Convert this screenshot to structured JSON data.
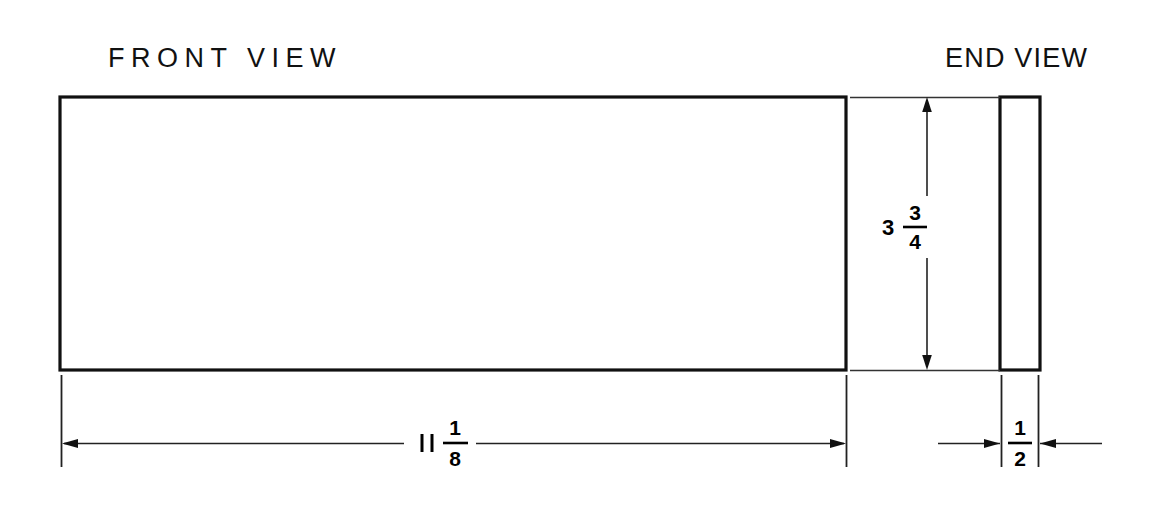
{
  "drawing": {
    "background_color": "#ffffff",
    "line_color": "#111111",
    "thin_line_color": "#333333",
    "views": [
      {
        "name": "front-view",
        "label": "FRONT VIEW",
        "shape": "rectangle",
        "x": 60,
        "y": 97,
        "width": 786,
        "height": 273,
        "line_weight": 3
      },
      {
        "name": "end-view",
        "label": "END VIEW",
        "shape": "rectangle",
        "x": 1000,
        "y": 97,
        "width": 40,
        "height": 273,
        "line_weight": 3
      }
    ],
    "dimensions": [
      {
        "name": "height-dimension",
        "value": "3 3/4",
        "whole": "3",
        "numerator": "3",
        "denominator": "4",
        "orientation": "vertical",
        "applies_to": "end-view",
        "from": 97,
        "to": 370,
        "line_x": 927,
        "arrow_style": "inside"
      },
      {
        "name": "length-dimension",
        "value": "11 1/8",
        "whole": "11",
        "numerator": "1",
        "denominator": "8",
        "orientation": "horizontal",
        "applies_to": "front-view",
        "from": 62,
        "to": 846,
        "line_y": 443,
        "arrow_style": "inside"
      },
      {
        "name": "thickness-dimension",
        "value": "1/2",
        "whole": "",
        "numerator": "1",
        "denominator": "2",
        "orientation": "horizontal",
        "applies_to": "end-view",
        "from": 1000,
        "to": 1040,
        "line_y": 443,
        "arrow_style": "outside"
      }
    ],
    "labels": {
      "front_view": "FRONT VIEW",
      "end_view": "END VIEW"
    }
  }
}
